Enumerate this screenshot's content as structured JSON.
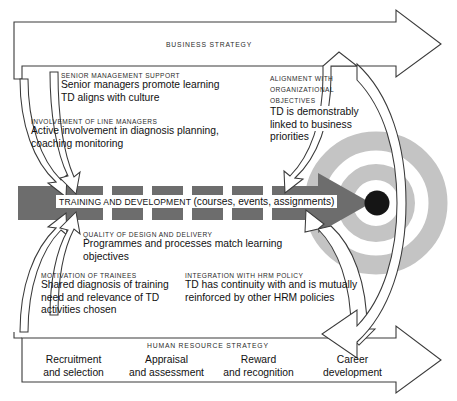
{
  "diagram": {
    "title_band_top": "BUSINESS STRATEGY",
    "title_band_bottom": "HUMAN RESOURCE STRATEGY",
    "center": {
      "label_prefix": "TRAINING AND DEVELOPMENT",
      "label_suffix": "(courses, events, assignments)"
    },
    "factors": [
      {
        "id": "senior-management-support",
        "caption": "SENIOR MANAGEMENT SUPPORT",
        "lines": [
          "Senior managers promote learning",
          "TD aligns with culture"
        ]
      },
      {
        "id": "involvement-of-line-managers",
        "caption": "INVOLVEMENT OF LINE MANAGERS",
        "lines": [
          "Active involvement in diagnosis planning,",
          "coaching monitoring"
        ]
      },
      {
        "id": "alignment-with-organizational-objectives",
        "caption_lines": [
          "ALIGNMENT WITH",
          "ORGANIZATIONAL",
          "OBJECTIVES"
        ],
        "lines": [
          "TD is demonstrably",
          "linked to business",
          "priorities"
        ]
      },
      {
        "id": "quality-of-design-and-delivery",
        "caption": "QUALITY OF DESIGN AND DELIVERY",
        "lines": [
          "Programmes and processes match learning",
          "objectives"
        ]
      },
      {
        "id": "motivation-of-trainees",
        "caption": "MOTIVATION OF TRAINEES",
        "lines": [
          "Shared diagnosis of training",
          "need and relevance of TD",
          "activities chosen"
        ]
      },
      {
        "id": "integration-with-hrm-policy",
        "caption": "INTEGRATION WITH HRM POLICY",
        "lines": [
          "TD has continuity with and is mutually",
          "reinforced by other HRM policies"
        ]
      }
    ],
    "hr_strategy_items": [
      {
        "line1": "Recruitment",
        "line2": "and selection"
      },
      {
        "line1": "Appraisal",
        "line2": "and assessment"
      },
      {
        "line1": "Reward",
        "line2": "and recognition"
      },
      {
        "line1": "Career",
        "line2": "development"
      }
    ],
    "colors": {
      "outline": "#3a3a3a",
      "arrow_fill": "#ffffff",
      "center_arrow": "#6d6d6d",
      "ring": "#c4c4c4",
      "target_center": "#151515",
      "background": "#ffffff"
    }
  }
}
